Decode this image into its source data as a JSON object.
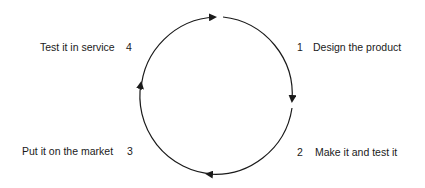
{
  "diagram": {
    "type": "cycle",
    "direction": "clockwise",
    "steps": [
      {
        "number": "1",
        "label": "Design the product"
      },
      {
        "number": "2",
        "label": "Make it and test it"
      },
      {
        "number": "3",
        "label": "Put it on the market"
      },
      {
        "number": "4",
        "label": "Test it in service"
      }
    ],
    "colors": {
      "line": "#1a1a1a",
      "text": "#1a1a1a",
      "background": "#ffffff"
    }
  }
}
